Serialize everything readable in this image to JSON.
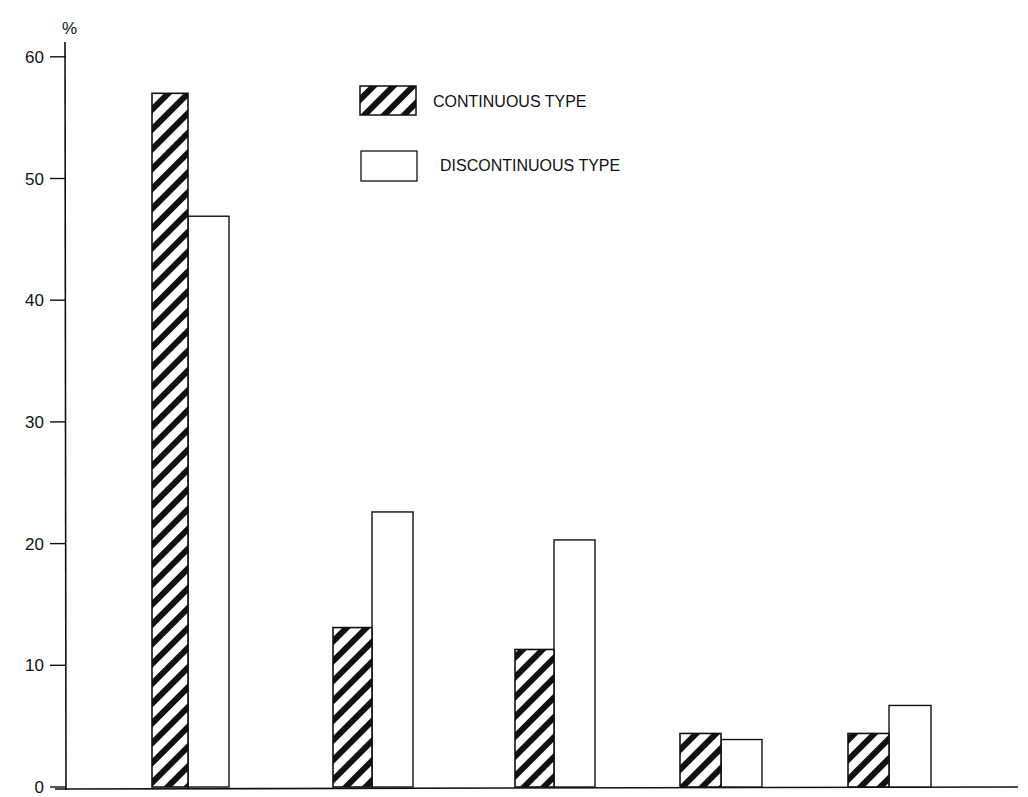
{
  "chart_data": {
    "type": "bar",
    "title": "",
    "xlabel": "",
    "ylabel": "%",
    "ylim": [
      0,
      60
    ],
    "yticks": [
      0,
      10,
      20,
      30,
      40,
      50,
      60
    ],
    "grid": false,
    "legend_position": "top-center",
    "categories": [
      "1",
      "2",
      "3",
      "4",
      "5"
    ],
    "category_labels_visible": false,
    "series": [
      {
        "name": "CONTINUOUS TYPE",
        "pattern": "diagonal-hatch",
        "values": [
          57.0,
          13.1,
          11.3,
          4.4,
          4.4
        ]
      },
      {
        "name": "DISCONTINUOUS TYPE",
        "pattern": "open",
        "values": [
          46.9,
          22.6,
          20.3,
          3.9,
          6.7
        ]
      }
    ]
  },
  "axis": {
    "y_unit": "%"
  },
  "legend": {
    "items": [
      {
        "label": "CONTINUOUS TYPE",
        "swatch": "hatched"
      },
      {
        "label": "DISCONTINUOUS TYPE",
        "swatch": "open"
      }
    ]
  },
  "colors": {
    "ink": "#111111",
    "background": "#ffffff"
  }
}
